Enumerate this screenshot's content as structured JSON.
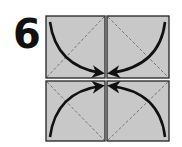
{
  "step": {
    "number": "6"
  },
  "diagram": {
    "square_fill": "#c8c8c8",
    "border_color": "#222222",
    "dash_color": "#777777",
    "arrow_color": "#111111",
    "squares": [
      {
        "position": "top-left",
        "arrow": "curved-arrow-down-right"
      },
      {
        "position": "top-right",
        "arrow": "curved-arrow-down-left"
      },
      {
        "position": "bottom-left",
        "arrow": "curved-arrow-up-right"
      },
      {
        "position": "bottom-right",
        "arrow": "curved-arrow-up-left"
      }
    ]
  }
}
